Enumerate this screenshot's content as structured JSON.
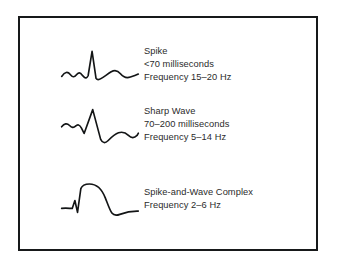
{
  "figure": {
    "border_color": "#17191a",
    "background_color": "#ffffff",
    "text_color": "#2b2b2b",
    "waveform_color": "#131516"
  },
  "entries": [
    {
      "icon": "eeg-spike-waveform-icon",
      "name": "Spike",
      "duration": "<70 milliseconds",
      "frequency": "Frequency 15–20 Hz"
    },
    {
      "icon": "eeg-sharp-wave-waveform-icon",
      "name": "Sharp Wave",
      "duration": "70–200 milliseconds",
      "frequency": "Frequency 5–14 Hz"
    },
    {
      "icon": "eeg-spike-and-wave-complex-waveform-icon",
      "name": "Spike-and-Wave Complex",
      "duration": "",
      "frequency": "Frequency 2–6 Hz"
    }
  ]
}
